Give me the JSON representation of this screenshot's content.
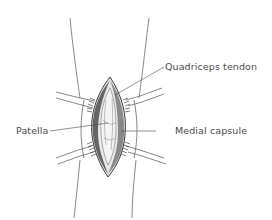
{
  "figure": {
    "labels": [
      {
        "id": "quadriceps-tendon",
        "text": "Quadriceps tendon"
      },
      {
        "id": "patella",
        "text": "Patella"
      },
      {
        "id": "medial-capsule",
        "text": "Medial capsule"
      }
    ]
  },
  "colors": {
    "outline": "#555555",
    "shading_dark": "#2a2a2a",
    "label_text": "#4a4a4a",
    "background": "#ffffff"
  }
}
